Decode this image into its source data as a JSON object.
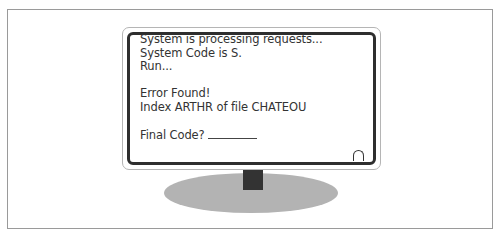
{
  "monitor": {
    "screen_lines": [
      "System is processing requests...",
      "System Code is S.",
      "Run...",
      "",
      "Error Found!",
      "Index ARTHR of file CHATEOU",
      "",
      "Final Code?"
    ],
    "final_code_value": ""
  },
  "colors": {
    "screen_border": "#2e2e2e",
    "stand_base": "#b3b3b3",
    "stand_neck": "#333333",
    "text": "#333333"
  }
}
